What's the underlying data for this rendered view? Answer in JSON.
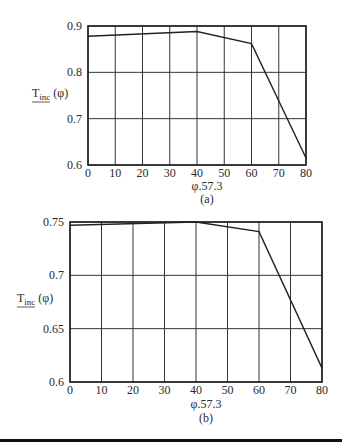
{
  "chart_data": [
    {
      "type": "line",
      "panel_label": "(a)",
      "title": "",
      "xlabel": "φ.57.3",
      "ylabel": "T_inc (φ)",
      "ylabel_main": "T",
      "ylabel_sub": "inc",
      "ylabel_arg": "(φ)",
      "xlim": [
        0,
        80
      ],
      "ylim": [
        0.6,
        0.9
      ],
      "x_ticks": [
        0,
        10,
        20,
        30,
        40,
        50,
        60,
        70,
        80
      ],
      "y_ticks": [
        0.6,
        0.7,
        0.8,
        0.9
      ],
      "y_tick_labels": [
        "0.6",
        "0.7",
        "0.8",
        "0.9"
      ],
      "grid": true,
      "legend": null,
      "series": [
        {
          "name": "T_inc",
          "x": [
            0,
            40,
            60,
            80
          ],
          "y": [
            0.878,
            0.888,
            0.862,
            0.615
          ]
        }
      ]
    },
    {
      "type": "line",
      "panel_label": "(b)",
      "title": "",
      "xlabel": "φ.57.3",
      "ylabel": "T_inc (φ)",
      "ylabel_main": "T",
      "ylabel_sub": "inc",
      "ylabel_arg": "(φ)",
      "xlim": [
        0,
        80
      ],
      "ylim": [
        0.6,
        0.75
      ],
      "x_ticks": [
        0,
        10,
        20,
        30,
        40,
        50,
        60,
        70,
        80
      ],
      "y_ticks": [
        0.6,
        0.65,
        0.7,
        0.75
      ],
      "y_tick_labels": [
        "0.6",
        "0.65",
        "0.7",
        "0.75"
      ],
      "grid": true,
      "legend": null,
      "series": [
        {
          "name": "T_inc",
          "x": [
            0,
            40,
            60,
            80
          ],
          "y": [
            0.747,
            0.75,
            0.741,
            0.613
          ]
        }
      ]
    }
  ],
  "layout": [
    {
      "left": 88,
      "right": 306,
      "top": 26,
      "bottom": 165,
      "ylabel_x": 32,
      "ylabel_y": 97,
      "ytick_x": 82,
      "xtick_y": 177,
      "xlabel_y": 190,
      "panel_y": 203
    },
    {
      "left": 70,
      "right": 322,
      "top": 22,
      "bottom": 182,
      "ylabel_x": 17,
      "ylabel_y": 102,
      "ytick_x": 64,
      "xtick_y": 194,
      "xlabel_y": 208,
      "panel_y": 222
    }
  ]
}
